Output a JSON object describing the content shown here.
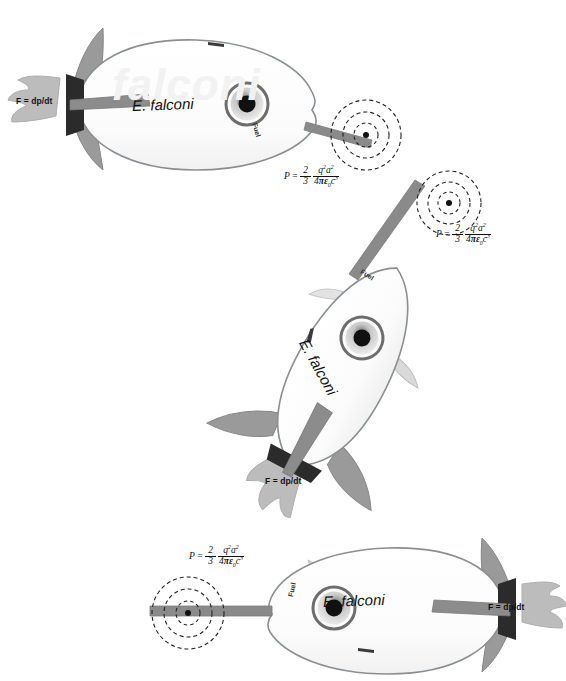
{
  "diagram": {
    "background_color": "#ffffff",
    "body_fill": "#fdfdfd",
    "body_stroke": "#8a8f94",
    "fin_fill": "#9a9a9a",
    "fin_stroke": "#7d7d7d",
    "nozzle_fill": "#2b2b2b",
    "beam_fill": "#8c8c8c",
    "flame_fill": "#b9b9b9",
    "window_ring": "#6d6d6d",
    "window_center": "#111111",
    "target_stroke": "#222222",
    "watermark_color": "#f2f2f2"
  },
  "formula": {
    "lhs": "P",
    "equals": "=",
    "frac1_num": "2",
    "frac1_den": "3",
    "frac2_num_q": "q",
    "frac2_num_q_exp": "2",
    "frac2_num_a": "a",
    "frac2_num_a_exp": "2",
    "frac2_den_4": "4",
    "frac2_den_pi": "π",
    "frac2_den_eps": "ε",
    "frac2_den_eps_sub": "0",
    "frac2_den_c": "c",
    "frac2_den_c_exp": "3",
    "plain": "P = (2/3) q²a² / (4πε₀c³)"
  },
  "labels": {
    "force": "F = dp/dt",
    "force_plain": "F = dp/dt",
    "fuel": "Fuel",
    "species": "E. falconi",
    "watermark": "falconi"
  },
  "rockets": [
    {
      "id": "rocket-top",
      "orientation_degrees": 0,
      "heading": "right",
      "species_label": "E. falconi",
      "fuel_label": "Fuel",
      "force_label": "F = dp/dt",
      "formula_label": "P = (2/3) q²a² / (4πε₀c³)"
    },
    {
      "id": "rocket-middle",
      "orientation_degrees": -62,
      "heading": "up-right",
      "species_label": "E. falconi",
      "fuel_label": "Fuel",
      "force_label": "F = dp/dt",
      "formula_label": "P = (2/3) q²a² / (4πε₀c³)"
    },
    {
      "id": "rocket-bottom",
      "orientation_degrees": 180,
      "heading": "left",
      "species_label": "E. falconi",
      "fuel_label": "Fuel",
      "force_label": "F = dp/dt",
      "formula_label": "P = (2/3) q²a² / (4πε₀c³)"
    }
  ],
  "targets": [
    {
      "id": "target-top",
      "rings": 3,
      "style": "dashed-concentric-circles"
    },
    {
      "id": "target-middle",
      "rings": 3,
      "style": "dashed-concentric-circles"
    },
    {
      "id": "target-bottom",
      "rings": 3,
      "style": "dashed-concentric-circles"
    }
  ]
}
